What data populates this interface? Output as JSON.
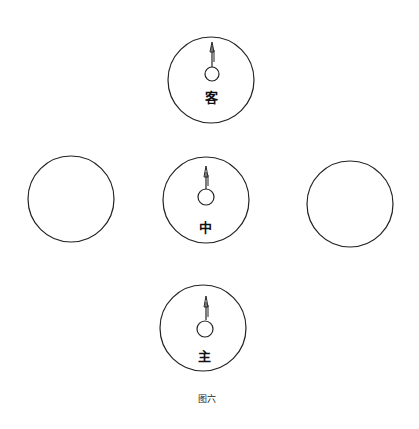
{
  "figure": {
    "caption": "图六",
    "stroke_color": "#222222",
    "circles": [
      {
        "id": "top",
        "label": "客",
        "cx": 211,
        "cy": 80,
        "r": 43,
        "has_pointer": true
      },
      {
        "id": "center",
        "label": "中",
        "cx": 206,
        "cy": 200,
        "r": 43,
        "has_pointer": true
      },
      {
        "id": "bottom",
        "label": "主",
        "cx": 203,
        "cy": 328,
        "r": 43,
        "has_pointer": true
      },
      {
        "id": "left",
        "label": "",
        "cx": 71,
        "cy": 199,
        "r": 43,
        "has_pointer": false
      },
      {
        "id": "right",
        "label": "",
        "cx": 350,
        "cy": 204,
        "r": 43,
        "has_pointer": false
      }
    ]
  }
}
